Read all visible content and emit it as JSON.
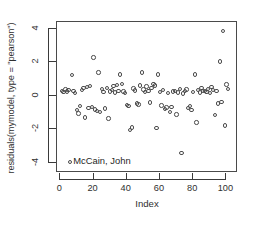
{
  "chart_data": {
    "type": "scatter",
    "title": "",
    "xlabel": "Index",
    "ylabel": "residuals(mymodel, type = \"pearson\")",
    "xlim": [
      -2,
      107
    ],
    "ylim": [
      -4.6,
      4.4
    ],
    "xticks": [
      0,
      20,
      40,
      60,
      80,
      100
    ],
    "ytick_labels": [
      "4",
      "2",
      "0",
      "-2",
      "-4"
    ],
    "yticks": [
      4,
      2,
      0,
      -2,
      -4
    ],
    "grid": false,
    "legend": null,
    "marker": "open-circle",
    "marker_color": "#4b4b4b",
    "annotations": [
      {
        "text": "McCain, John",
        "x": 6,
        "y": -3.95,
        "point_index": 5
      }
    ],
    "x": [
      1,
      2,
      3,
      4,
      5,
      6,
      7,
      8,
      9,
      10,
      11,
      12,
      13,
      14,
      15,
      16,
      17,
      18,
      19,
      20,
      21,
      22,
      23,
      24,
      25,
      26,
      27,
      28,
      29,
      30,
      31,
      32,
      33,
      34,
      35,
      36,
      37,
      38,
      39,
      40,
      41,
      42,
      43,
      44,
      45,
      46,
      47,
      48,
      49,
      50,
      51,
      52,
      53,
      54,
      55,
      56,
      57,
      58,
      59,
      60,
      61,
      62,
      63,
      64,
      65,
      66,
      67,
      68,
      69,
      70,
      71,
      72,
      73,
      74,
      75,
      76,
      77,
      78,
      79,
      80,
      81,
      82,
      83,
      84,
      85,
      86,
      87,
      88,
      89,
      90,
      91,
      92,
      93,
      94,
      95,
      96,
      97,
      98,
      99,
      100,
      101
    ],
    "y": [
      0.3,
      0.22,
      0.38,
      0.26,
      0.33,
      -3.95,
      1.25,
      0.28,
      0.18,
      -0.85,
      -1.05,
      -0.62,
      0.35,
      0.45,
      -1.3,
      0.52,
      -0.72,
      0.58,
      -0.65,
      2.28,
      -0.82,
      -0.9,
      1.38,
      -0.95,
      0.4,
      0.22,
      -0.75,
      0.48,
      -1.35,
      0.25,
      0.34,
      0.58,
      0.2,
      0.65,
      0.3,
      1.28,
      0.7,
      0.26,
      0.18,
      -0.55,
      -0.62,
      -2.05,
      -1.88,
      0.44,
      0.32,
      -0.45,
      -0.52,
      0.62,
      1.4,
      0.38,
      0.24,
      0.55,
      0.3,
      -0.4,
      0.48,
      0.72,
      0.62,
      -1.92,
      1.28,
      0.22,
      -0.58,
      0.34,
      -0.78,
      -0.7,
      0.18,
      -0.95,
      -0.68,
      0.26,
      0.3,
      -1.12,
      0.2,
      0.42,
      -3.4,
      0.15,
      0.28,
      0.38,
      -0.72,
      -0.6,
      -0.85,
      0.24,
      1.28,
      -1.6,
      0.33,
      0.2,
      0.45,
      0.28,
      0.3,
      0.22,
      0.4,
      0.18,
      0.52,
      0.35,
      -1.15,
      0.3,
      -0.45,
      2.05,
      -0.38,
      3.88,
      -1.78,
      0.68,
      0.42
    ]
  }
}
